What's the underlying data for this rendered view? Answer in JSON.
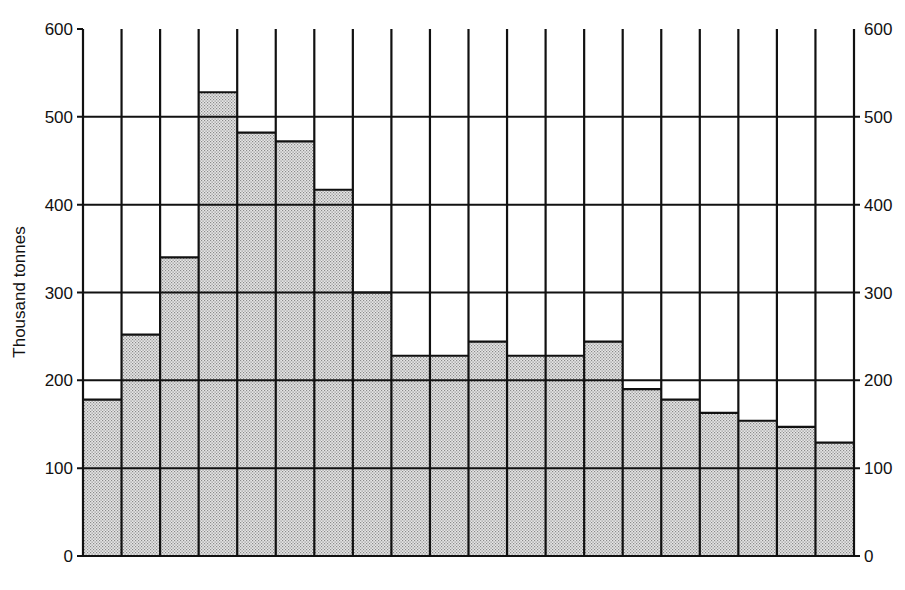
{
  "chart_data": {
    "type": "bar",
    "title": "",
    "xlabel": "",
    "ylabel": "Thousand tonnes",
    "ylim": [
      0,
      600
    ],
    "yticks": [
      0,
      100,
      200,
      300,
      400,
      500,
      600
    ],
    "ytick_labels_left": [
      "0",
      "100",
      "200",
      "300",
      "400",
      "500",
      "600"
    ],
    "ytick_labels_right": [
      "0",
      "100",
      "200",
      "300",
      "400",
      "500",
      "600"
    ],
    "grid": true,
    "legend": null,
    "categories": [
      "1",
      "2",
      "3",
      "4",
      "5",
      "6",
      "7",
      "8",
      "9",
      "10",
      "11",
      "12",
      "13",
      "14",
      "15",
      "16",
      "17",
      "18",
      "19",
      "20"
    ],
    "category_labels_visible": false,
    "values": [
      178,
      252,
      340,
      528,
      482,
      472,
      417,
      300,
      228,
      228,
      244,
      228,
      228,
      244,
      190,
      178,
      163,
      154,
      147,
      129
    ],
    "bar_fill": "#d4d4d4",
    "line_color": "#111111"
  }
}
